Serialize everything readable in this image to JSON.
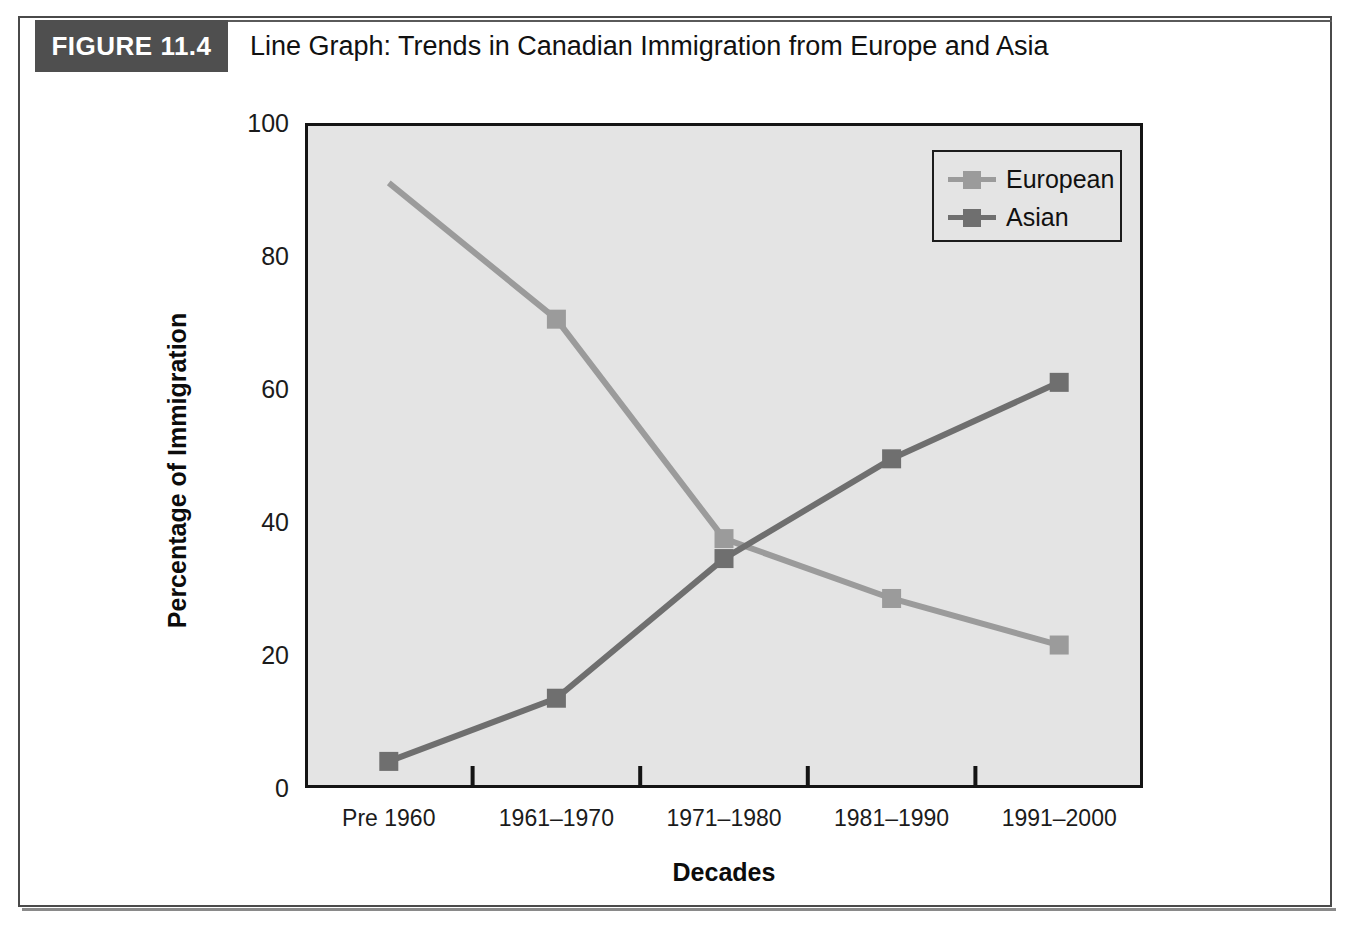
{
  "figure": {
    "tag": "FIGURE 11.4",
    "title": "Line Graph: Trends in Canadian Immigration from Europe and Asia"
  },
  "colors": {
    "european": "#9b9b9b",
    "asian": "#6f6f6f",
    "plot_background": "#e4e4e4",
    "axis": "#141414",
    "header_band": "#4f4f4f"
  },
  "chart_data": {
    "type": "line",
    "title": "Line Graph: Trends in Canadian Immigration from Europe and Asia",
    "xlabel": "Decades",
    "ylabel": "Percentage of Immigration",
    "categories": [
      "Pre 1960",
      "1961–1970",
      "1971–1980",
      "1981–1990",
      "1991–2000"
    ],
    "ylim": [
      0,
      100
    ],
    "yticks": [
      0,
      20,
      40,
      60,
      80,
      100
    ],
    "ytick_labels": [
      "0",
      "20",
      "40",
      "60",
      "80",
      "100"
    ],
    "grid": false,
    "legend_position": "top-right",
    "series": [
      {
        "name": "European",
        "color": "#9b9b9b",
        "values": [
          91,
          70.5,
          37.5,
          28.5,
          21.5
        ]
      },
      {
        "name": "Asian",
        "color": "#6f6f6f",
        "values": [
          4,
          13.5,
          34.5,
          49.5,
          61
        ]
      }
    ]
  },
  "legend": {
    "items": [
      {
        "label": "European"
      },
      {
        "label": "Asian"
      }
    ]
  }
}
